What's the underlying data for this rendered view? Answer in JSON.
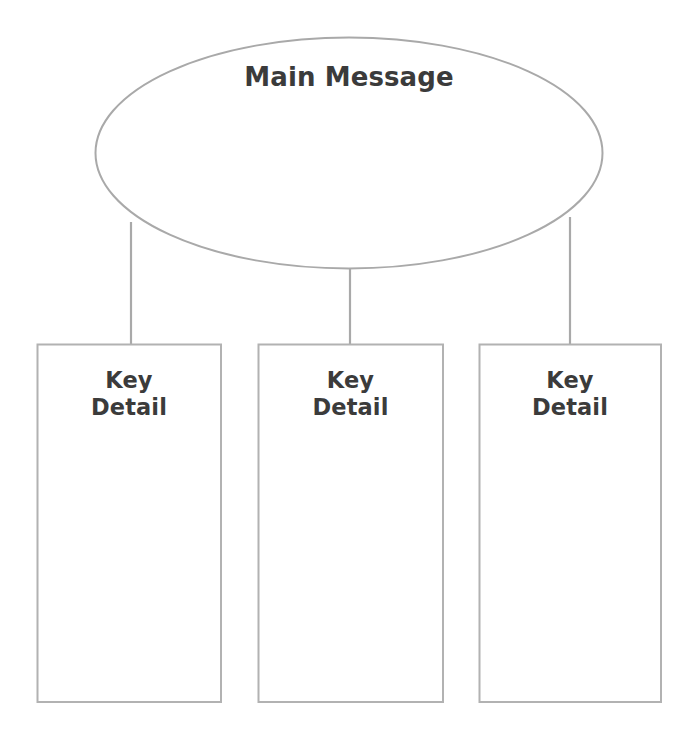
{
  "diagram": {
    "type": "hierarchy-chart",
    "background_color": "#ffffff",
    "stroke_color": "#a9a9a9",
    "text_color": "#3b3b3b",
    "root": {
      "id": "main-message",
      "shape": "ellipse",
      "label": "Main Message",
      "text_align": "top-center",
      "geometry": {
        "cx": 349,
        "cy": 153,
        "rx": 253,
        "ry": 116
      }
    },
    "children": [
      {
        "id": "key-detail-1",
        "shape": "rectangle",
        "label": "Key\nDetail",
        "label_line_1": "Key",
        "label_line_2": "Detail",
        "geometry": {
          "x": 37,
          "y": 344,
          "width": 184,
          "height": 358
        }
      },
      {
        "id": "key-detail-2",
        "shape": "rectangle",
        "label": "Key\nDetail",
        "label_line_1": "Key",
        "label_line_2": "Detail",
        "geometry": {
          "x": 258,
          "y": 344,
          "width": 185,
          "height": 358
        }
      },
      {
        "id": "key-detail-3",
        "shape": "rectangle",
        "label": "Key\nDetail",
        "label_line_1": "Key",
        "label_line_2": "Detail",
        "geometry": {
          "x": 479,
          "y": 344,
          "width": 182,
          "height": 358
        }
      }
    ],
    "connectors": [
      {
        "id": "connector-1",
        "from": "main-message",
        "to": "key-detail-1",
        "x1": 131,
        "y1": 222,
        "x2": 131,
        "y2": 344
      },
      {
        "id": "connector-2",
        "from": "main-message",
        "to": "key-detail-2",
        "x1": 350,
        "y1": 269,
        "x2": 350,
        "y2": 344
      },
      {
        "id": "connector-3",
        "from": "main-message",
        "to": "key-detail-3",
        "x1": 570,
        "y1": 217,
        "x2": 570,
        "y2": 344
      }
    ]
  }
}
